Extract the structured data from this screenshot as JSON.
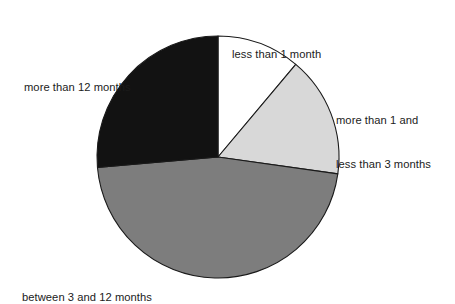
{
  "chart_data": {
    "type": "pie",
    "title": "",
    "subtitle": "",
    "xlabel": "",
    "ylabel": "",
    "legend_position": "none",
    "labels_position": "outside",
    "grid": false,
    "start_angle_deg": 0,
    "direction": "clockwise",
    "center": {
      "x": 218,
      "y": 157
    },
    "radius": 121,
    "categories": [
      "less than 1 month",
      "more than 1 and\nless than 3 months",
      "between 3 and 12 months",
      "more than 12 months"
    ],
    "values": [
      11,
      16,
      46,
      27
    ],
    "slices": [
      {
        "label": "less than 1 month",
        "label_line1": "less than 1 month",
        "label_line2": "",
        "value": 11,
        "percent": 11,
        "start_angle_deg": 0,
        "end_angle_deg": 40,
        "fill": "#ffffff",
        "stroke": "#1a1a1a"
      },
      {
        "label": "more than 1 and less than 3 months",
        "label_line1": "more than 1 and",
        "label_line2": "less than 3 months",
        "value": 16,
        "percent": 16,
        "start_angle_deg": 40,
        "end_angle_deg": 98,
        "fill": "#d8d8d8",
        "stroke": "#1a1a1a"
      },
      {
        "label": "between 3 and 12 months",
        "label_line1": "between 3 and 12 months",
        "label_line2": "",
        "value": 46,
        "percent": 46,
        "start_angle_deg": 98,
        "end_angle_deg": 265,
        "fill": "#7d7d7d",
        "stroke": "#1a1a1a"
      },
      {
        "label": "more than 12 months",
        "label_line1": "more than 12 months",
        "label_line2": "",
        "value": 27,
        "percent": 27,
        "start_angle_deg": 265,
        "end_angle_deg": 360,
        "fill": "#121212",
        "stroke": "#1a1a1a"
      }
    ],
    "colors": {
      "slice_white": "#ffffff",
      "slice_light_gray": "#d8d8d8",
      "slice_mid_gray": "#7d7d7d",
      "slice_black": "#121212",
      "outline": "#1a1a1a",
      "background": "#ffffff",
      "text": "#1b1b1b"
    }
  }
}
